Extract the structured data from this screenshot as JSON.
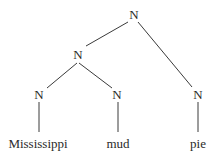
{
  "diagram": {
    "type": "syntax-tree",
    "nodes": {
      "root": {
        "label": "N"
      },
      "left_inner": {
        "label": "N"
      },
      "n_mississippi": {
        "label": "N"
      },
      "n_mud": {
        "label": "N"
      },
      "n_pie": {
        "label": "N"
      }
    },
    "leaves": {
      "mississippi": "Mississippi",
      "mud": "mud",
      "pie": "pie"
    },
    "edges": [
      [
        "root",
        "left_inner"
      ],
      [
        "root",
        "n_pie"
      ],
      [
        "left_inner",
        "n_mississippi"
      ],
      [
        "left_inner",
        "n_mud"
      ],
      [
        "n_mississippi",
        "mississippi"
      ],
      [
        "n_mud",
        "mud"
      ],
      [
        "n_pie",
        "pie"
      ]
    ]
  }
}
